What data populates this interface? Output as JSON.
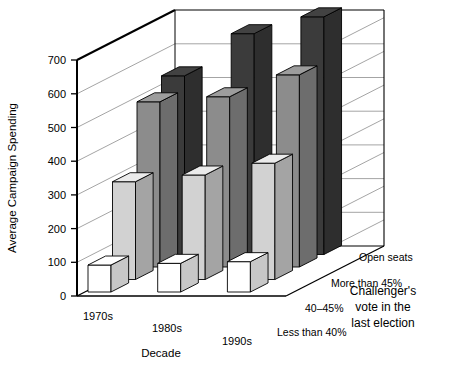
{
  "figure": {
    "y_axis_title": "Average Campaign Spending",
    "x_axis_title": "Decade",
    "depth_axis_title_line1": "Challenger's",
    "depth_axis_title_line2": "vote in the",
    "depth_axis_title_line3": "last election"
  },
  "colors": {
    "series_less_than_40": "#ffffff",
    "series_40_45": "#d2d2d2",
    "series_more_than_45": "#8c8c8c",
    "series_open_seats": "#3b3b3b",
    "axis_line": "#000000",
    "grid_line": "#9a9a9a",
    "background": "#ffffff"
  },
  "chart_data": {
    "type": "bar",
    "title": "",
    "xlabel": "Decade",
    "ylabel": "Average Campaign Spending",
    "zlabel": "Challenger's vote in the last election",
    "grid": true,
    "legend_position": "depth-axis",
    "ylim": [
      0,
      700
    ],
    "yticks": [
      0,
      100,
      200,
      300,
      400,
      500,
      600,
      700
    ],
    "ytick_labels": [
      "0",
      "100",
      "200",
      "300",
      "400",
      "500",
      "600",
      "700"
    ],
    "categories": [
      "1970s",
      "1980s",
      "1990s"
    ],
    "depth_categories": [
      "Less than 40%",
      "40–45%",
      "More than 45%",
      "Open seats"
    ],
    "series": [
      {
        "name": "Less than 40%",
        "values": [
          80,
          85,
          90
        ]
      },
      {
        "name": "40–45%",
        "values": [
          290,
          310,
          345
        ]
      },
      {
        "name": "More than 45%",
        "values": [
          490,
          505,
          570
        ]
      },
      {
        "name": "Open seats",
        "values": [
          530,
          655,
          705
        ]
      }
    ]
  }
}
